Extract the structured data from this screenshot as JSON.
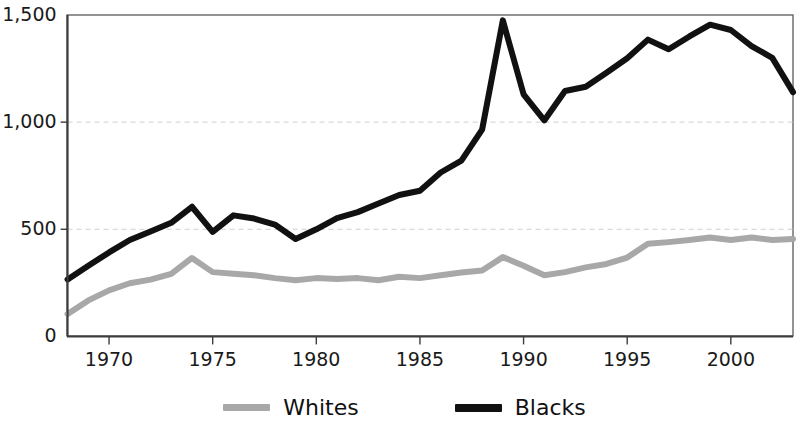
{
  "chart_data": {
    "type": "line",
    "title": "",
    "subtitle": "",
    "xlabel": "",
    "ylabel": "",
    "xlim": [
      1968,
      2003
    ],
    "ylim": [
      0,
      1500
    ],
    "grid": "horizontal-dashed-at-500-and-1000",
    "legend_position": "bottom-center",
    "x_tick_labels": [
      "1970",
      "1975",
      "1980",
      "1985",
      "1990",
      "1995",
      "2000"
    ],
    "x_ticks": [
      1970,
      1975,
      1980,
      1985,
      1990,
      1995,
      2000
    ],
    "y_tick_labels": [
      "0",
      "500",
      "1,000",
      "1,500"
    ],
    "y_ticks": [
      0,
      500,
      1000,
      1500
    ],
    "x": [
      1968,
      1969,
      1970,
      1971,
      1972,
      1973,
      1974,
      1975,
      1976,
      1977,
      1978,
      1979,
      1980,
      1981,
      1982,
      1983,
      1984,
      1985,
      1986,
      1987,
      1988,
      1989,
      1990,
      1991,
      1992,
      1993,
      1994,
      1995,
      1996,
      1997,
      1998,
      1999,
      2000,
      2001,
      2002,
      2003
    ],
    "series": [
      {
        "name": "Whites",
        "color": "#a8a8a8",
        "values": [
          104,
          168,
          215,
          248,
          265,
          292,
          366,
          300,
          292,
          285,
          272,
          262,
          272,
          268,
          272,
          262,
          278,
          272,
          285,
          298,
          308,
          370,
          330,
          285,
          300,
          322,
          338,
          368,
          432,
          440,
          450,
          462,
          450,
          462,
          450,
          455
        ]
      },
      {
        "name": "Blacks",
        "color": "#111111",
        "values": [
          266,
          330,
          392,
          450,
          490,
          530,
          605,
          488,
          565,
          550,
          522,
          455,
          500,
          552,
          580,
          620,
          660,
          680,
          765,
          820,
          965,
          1475,
          1130,
          1008,
          1145,
          1165,
          1230,
          1298,
          1385,
          1340,
          1400,
          1455,
          1430,
          1355,
          1300,
          1140
        ]
      }
    ]
  },
  "legend": {
    "entries": [
      {
        "label": "Whites",
        "icon": "line-swatch-gray"
      },
      {
        "label": "Blacks",
        "icon": "line-swatch-black"
      }
    ]
  },
  "axes": {
    "y_labels": [
      "1,500",
      "1,000",
      "500",
      "0"
    ],
    "x_labels": [
      "1970",
      "1975",
      "1980",
      "1985",
      "1990",
      "1995",
      "2000"
    ]
  },
  "colors": {
    "whites_line": "#a8a8a8",
    "blacks_line": "#111111",
    "axis": "#4a4a4a",
    "gridline": "#cfcfcf",
    "background": "#ffffff",
    "text": "#1a1a1a"
  }
}
